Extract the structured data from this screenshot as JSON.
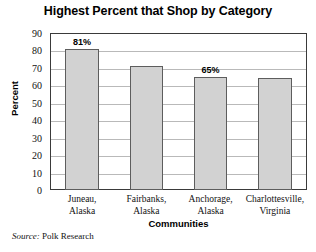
{
  "chart_data": {
    "type": "bar",
    "title": "Highest Percent that Shop by Category",
    "xlabel": "Communities",
    "ylabel": "Percent",
    "categories": [
      "Juneau, Alaska",
      "Fairbanks, Alaska",
      "Anchorage, Alaska",
      "Charlottesville, Virginia"
    ],
    "category_lines": [
      [
        "Juneau,",
        "Alaska"
      ],
      [
        "Fairbanks,",
        "Alaska"
      ],
      [
        "Anchorage,",
        "Alaska"
      ],
      [
        "Charlottesville,",
        "Virginia"
      ]
    ],
    "values": [
      81,
      71,
      65,
      64
    ],
    "point_labels": [
      "81%",
      "",
      "65%",
      ""
    ],
    "ylim": [
      0,
      90
    ],
    "ytick_values": [
      0,
      10,
      20,
      30,
      40,
      50,
      60,
      70,
      80,
      90
    ],
    "ytick_labels": [
      "0",
      "10",
      "20",
      "30",
      "40",
      "50",
      "60",
      "70",
      "80",
      "90"
    ],
    "grid": true,
    "legend": "none",
    "bar_color": "#d2d2d2",
    "bar_border_color": "#5d5d5d",
    "gridline_color": "#b9b9b9",
    "frame_color": "#3a3a3a"
  },
  "source": {
    "label": "Source:",
    "text": "Polk Research"
  }
}
